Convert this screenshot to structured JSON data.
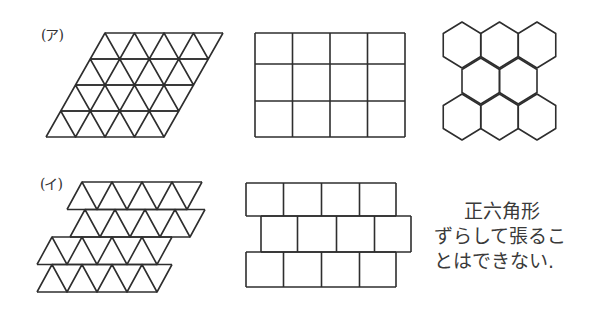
{
  "labels": {
    "a": "(ア)",
    "i": "(イ)"
  },
  "note": {
    "line1": "正六角形",
    "line2": "ずらして張るこ",
    "line3": "とはできない."
  },
  "figures": {
    "triangle_rhombus": {
      "rows": 4,
      "cols": 4,
      "x0": 105,
      "y0": 33,
      "unit": 29.5,
      "row_h": 26
    },
    "square_grid": {
      "rows": 3,
      "cols": 4,
      "x": [
        255,
        292.5,
        330,
        367.5,
        405
      ],
      "y": [
        33,
        64,
        101,
        137
      ]
    },
    "hexagon_grid": {
      "half_w": 18.75,
      "rows": [
        {
          "cy": 45,
          "cx": [
            462,
            499.5,
            537
          ]
        },
        {
          "cy": 81,
          "cx": [
            480.75,
            518.25
          ]
        },
        {
          "cy": 117,
          "cx": [
            462,
            499.5,
            537
          ]
        }
      ]
    },
    "triangle_strips_shifted": {
      "count": 4,
      "cols": 4,
      "unit": 30,
      "row_h": 27.5,
      "strips": [
        {
          "x0": 82,
          "y0": 182
        },
        {
          "x0": 85,
          "y0": 209.5
        },
        {
          "x0": 52,
          "y0": 237
        },
        {
          "x0": 52,
          "y0": 264.5
        }
      ]
    },
    "square_bricks": {
      "rows": [
        {
          "y_top": 183,
          "y_bot": 216,
          "x": [
            246,
            283.5,
            321.5,
            359.5,
            396
          ]
        },
        {
          "y_top": 216,
          "y_bot": 252,
          "x": [
            261,
            297.5,
            336.5,
            374.5,
            411
          ]
        },
        {
          "y_top": 252,
          "y_bot": 287,
          "x": [
            246,
            283.5,
            321.5,
            359.5,
            396
          ]
        }
      ]
    }
  },
  "colors": {
    "stroke": "#2e2e2e",
    "background": "#ffffff"
  }
}
